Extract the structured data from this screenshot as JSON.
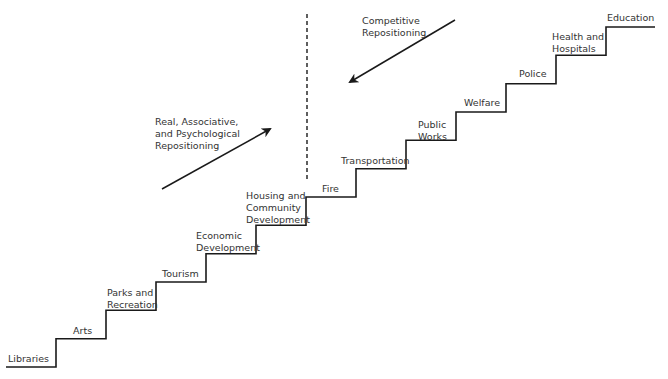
{
  "diagram": {
    "title": "",
    "line_color": "#1a1a1a",
    "text_color": "#333333",
    "steps": [
      {
        "label": "Libraries"
      },
      {
        "label": "Arts"
      },
      {
        "label": "Parks and\nRecreation"
      },
      {
        "label": "Tourism"
      },
      {
        "label": "Economic\nDevelopment"
      },
      {
        "label": "Housing and\nCommunity\nDevelopment"
      },
      {
        "label": "Fire"
      },
      {
        "label": "Transportation"
      },
      {
        "label": "Public\nWorks"
      },
      {
        "label": "Welfare"
      },
      {
        "label": "Police"
      },
      {
        "label": "Health and\nHospitals"
      },
      {
        "label": "Education"
      }
    ],
    "annotations": {
      "left_arrow_label": "Real, Associative,\nand Psychological\nRepositioning",
      "right_arrow_label": "Competitive\nRepositioning"
    }
  }
}
